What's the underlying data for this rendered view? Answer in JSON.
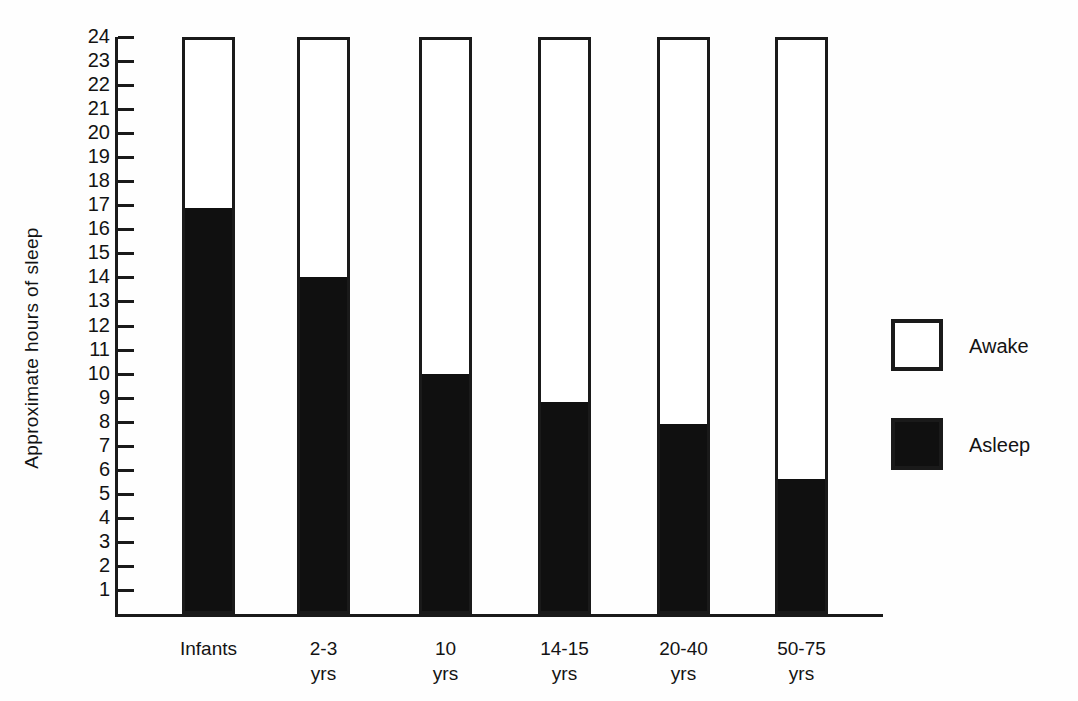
{
  "chart_data": {
    "type": "bar",
    "title": "",
    "subtitle": "",
    "xlabel": "",
    "ylabel": "Approximate hours of sleep",
    "ylim": [
      0,
      24
    ],
    "ytick_step": 1,
    "ytick_labels": [
      "24",
      "23",
      "22",
      "21",
      "20",
      "19",
      "18",
      "17",
      "16",
      "15",
      "14",
      "13",
      "12",
      "11",
      "10",
      "9",
      "8",
      "7",
      "6",
      "5",
      "4",
      "3",
      "2",
      "1"
    ],
    "grid": false,
    "stacked": true,
    "legend_position": "right",
    "categories": [
      "Infants",
      "2-3\nyrs",
      "10\nyrs",
      "14-15\nyrs",
      "20-40\nyrs",
      "50-75\nyrs"
    ],
    "series": [
      {
        "name": "Asleep",
        "color": "#101010",
        "values": [
          16.9,
          14.0,
          10.0,
          8.8,
          7.9,
          5.6
        ]
      },
      {
        "name": "Awake",
        "color": "#ffffff",
        "values": [
          7.1,
          10.0,
          14.0,
          15.2,
          16.1,
          18.4
        ]
      }
    ],
    "total_per_bar": 24,
    "annotations": []
  },
  "legend": {
    "items": [
      {
        "label": "Awake",
        "swatch": "hollow-square-icon"
      },
      {
        "label": "Asleep",
        "swatch": "filled-square-icon"
      }
    ]
  },
  "colors": {
    "ink": "#1a1a1a",
    "fill_asleep": "#101010",
    "fill_awake": "#ffffff",
    "background": "#fefefe"
  }
}
